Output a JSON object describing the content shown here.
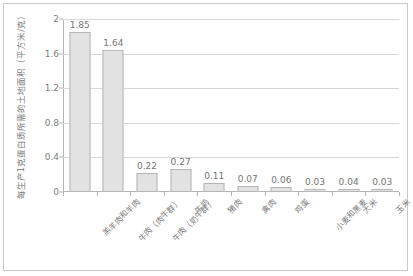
{
  "chart_data": {
    "type": "bar",
    "title": "",
    "subtitle": "",
    "xlabel": "",
    "ylabel": "每生产1克蛋白质所需的土地面积（平方米/克）",
    "ylim": [
      0,
      2
    ],
    "yticks": [
      "0",
      "0.4",
      "0.8",
      "1.2",
      "1.6",
      "2"
    ],
    "ytick_values": [
      0,
      0.4,
      0.8,
      1.2,
      1.6,
      2
    ],
    "grid": "horizontal",
    "legend": "none",
    "categories": [
      "羔羊肉和羊肉",
      "牛肉（肉牛群）",
      "牛肉（奶牛群）",
      "牛奶",
      "猪肉",
      "禽肉",
      "鸡蛋",
      "小麦和黑麦",
      "大米",
      "玉米"
    ],
    "values": [
      1.85,
      1.64,
      0.22,
      0.27,
      0.11,
      0.07,
      0.06,
      0.03,
      0.04,
      0.03
    ],
    "value_labels": [
      "1.85",
      "1.64",
      "0.22",
      "0.27",
      "0.11",
      "0.07",
      "0.06",
      "0.03",
      "0.04",
      "0.03"
    ],
    "bar_fill": "#e2e2e2",
    "bar_border": "#b6b6b6",
    "gridline_color": "#d7d7d7",
    "axis_color": "#b4b4b4",
    "text_color": "#7a7a7a",
    "frame_color": "#c9c9c9"
  }
}
